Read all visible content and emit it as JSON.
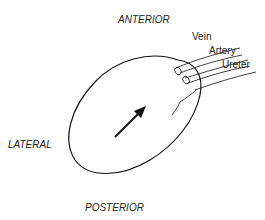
{
  "diagram": {
    "orientation": {
      "top": "ANTERIOR",
      "bottom": "POSTERIOR",
      "left": "LATERAL"
    },
    "structures": {
      "vein": "Vein",
      "artery": "Artery",
      "ureter": "Ureter"
    },
    "colors": {
      "stroke": "#111111",
      "text": "#222222",
      "background": "#ffffff"
    }
  }
}
